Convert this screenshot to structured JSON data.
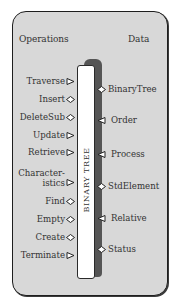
{
  "diagram": {
    "title": "BINARY TREE",
    "headings": {
      "operations": "Operations",
      "data": "Data"
    },
    "colors": {
      "panel_fill": "#d8d8d8",
      "border": "#1e1e1e",
      "bar_fill": "#ffffff",
      "bar_shadow": "#555555",
      "text": "#333333"
    },
    "operations": [
      {
        "label": "Traverse",
        "connector": "triangle-right-icon"
      },
      {
        "label": "Insert",
        "connector": "diamond-icon"
      },
      {
        "label": "DeleteSub",
        "connector": "diamond-icon"
      },
      {
        "label": "Update",
        "connector": "triangle-right-icon"
      },
      {
        "label": "Retrieve",
        "connector": "triangle-right-icon"
      },
      {
        "label": "Character-",
        "label2": "istics",
        "connector": "triangle-right-icon"
      },
      {
        "label": "Find",
        "connector": "diamond-icon"
      },
      {
        "label": "Empty",
        "connector": "diamond-icon"
      },
      {
        "label": "Create",
        "connector": "diamond-icon"
      },
      {
        "label": "Terminate",
        "connector": "triangle-right-icon"
      }
    ],
    "data": [
      {
        "label": "BinaryTree",
        "connector": "diamond-icon"
      },
      {
        "label": "Order",
        "connector": "triangle-left-icon"
      },
      {
        "label": "Process",
        "connector": "triangle-left-icon"
      },
      {
        "label": "StdElement",
        "connector": "diamond-icon"
      },
      {
        "label": "Relative",
        "connector": "triangle-left-icon"
      },
      {
        "label": "Status",
        "connector": "diamond-icon"
      }
    ]
  }
}
